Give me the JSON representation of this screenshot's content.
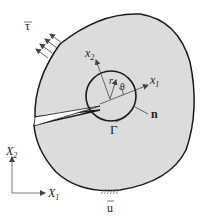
{
  "diagram": {
    "colors": {
      "body_fill": "#dcdcdc",
      "outline": "#1a1a1a",
      "text": "#222222",
      "background": "#ffffff"
    },
    "labels": {
      "traction": "τ",
      "local_x2": "x",
      "local_x2_sub": "2",
      "local_x1": "x",
      "local_x1_sub": "1",
      "radius": "r",
      "angle": "θ",
      "normal": "n",
      "contour": "Γ",
      "global_X2": "X",
      "global_X2_sub": "2",
      "global_X1": "X",
      "global_X1_sub": "1",
      "displacement": "u"
    },
    "elements": {
      "body": "irregular closed region",
      "crack": "wedge-shaped slit from left boundary to center",
      "contour": "circle around crack tip",
      "traction_arrows_count": 4,
      "support": "hatched fixed boundary at bottom"
    }
  }
}
